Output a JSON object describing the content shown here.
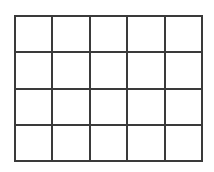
{
  "diagram": {
    "type": "grid",
    "rows": 4,
    "columns": 5,
    "line_color": "#3a3a3a",
    "background": "#ffffff",
    "cells": [
      [
        "",
        "",
        "",
        "",
        ""
      ],
      [
        "",
        "",
        "",
        "",
        ""
      ],
      [
        "",
        "",
        "",
        "",
        ""
      ],
      [
        "",
        "",
        "",
        "",
        ""
      ]
    ]
  }
}
